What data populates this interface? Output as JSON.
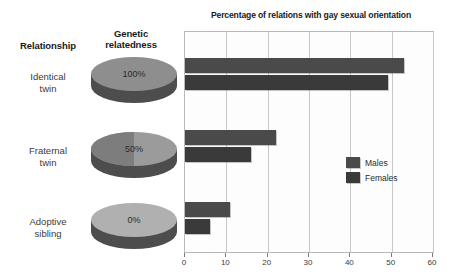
{
  "headers": {
    "relationship": "Relationship",
    "relatedness_line1": "Genetic",
    "relatedness_line2": "relatedness"
  },
  "rows": [
    {
      "label_line1": "Identical",
      "label_line2": "twin",
      "relatedness": "100%"
    },
    {
      "label_line1": "Fraternal",
      "label_line2": "twin",
      "relatedness": "50%"
    },
    {
      "label_line1": "Adoptive",
      "label_line2": "sibling",
      "relatedness": "0%"
    }
  ],
  "legend": {
    "males_label": "Males",
    "females_label": "Females",
    "males_color": "#4a4a4a",
    "females_color": "#3a3a3a"
  },
  "chart_data": {
    "type": "bar",
    "orientation": "horizontal",
    "title": "Percentage of relations with gay sexual orientation",
    "xlabel": "",
    "ylabel": "",
    "categories": [
      "Identical twin",
      "Fraternal twin",
      "Adoptive sibling"
    ],
    "series": [
      {
        "name": "Males",
        "values": [
          53,
          22,
          11
        ]
      },
      {
        "name": "Females",
        "values": [
          49,
          16,
          6
        ]
      }
    ],
    "xlim": [
      0,
      60
    ],
    "xticks": [
      0,
      10,
      20,
      30,
      40,
      50,
      60
    ],
    "xtick_labels": [
      "0",
      "10",
      "20",
      "30",
      "40",
      "50",
      "60"
    ],
    "grid": true,
    "legend_position": "right-middle",
    "genetic_relatedness": [
      "100%",
      "50%",
      "0%"
    ]
  }
}
